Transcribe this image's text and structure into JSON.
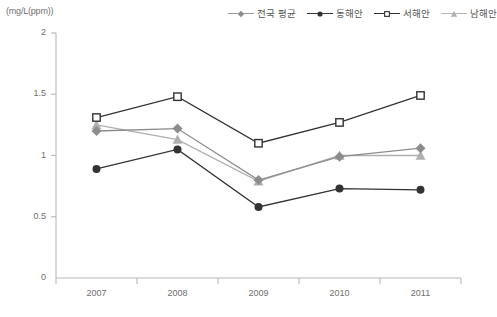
{
  "axis_unit_label": "(mg/L(ppm))",
  "legend": {
    "items": [
      {
        "label": "전국 평균",
        "marker": "diamond",
        "color": "#8c8c8c",
        "line_color": "#9a9a9a"
      },
      {
        "label": "동해안",
        "marker": "circle",
        "color": "#333333",
        "line_color": "#333333"
      },
      {
        "label": "서해안",
        "marker": "square-open",
        "color": "#333333",
        "line_color": "#333333"
      },
      {
        "label": "남해안",
        "marker": "triangle",
        "color": "#b0b0b0",
        "line_color": "#b5b5b5"
      }
    ]
  },
  "chart_data": {
    "type": "line",
    "title": "",
    "xlabel": "",
    "ylabel": "(mg/L(ppm))",
    "categories": [
      "2007",
      "2008",
      "2009",
      "2010",
      "2011"
    ],
    "ylim": [
      0,
      2
    ],
    "yticks": [
      0,
      0.5,
      1,
      1.5,
      2
    ],
    "ytick_labels": [
      "0",
      "0.5",
      "1",
      "1.5",
      "2"
    ],
    "grid": false,
    "legend_position": "top-right",
    "series": [
      {
        "name": "전국 평균",
        "marker": "diamond",
        "color": "#8c8c8c",
        "values": [
          1.2,
          1.22,
          0.8,
          0.99,
          1.06
        ]
      },
      {
        "name": "동해안",
        "marker": "circle",
        "color": "#333333",
        "values": [
          0.89,
          1.05,
          0.58,
          0.73,
          0.72
        ]
      },
      {
        "name": "서해안",
        "marker": "square-open",
        "color": "#333333",
        "values": [
          1.31,
          1.48,
          1.1,
          1.27,
          1.49
        ]
      },
      {
        "name": "남해안",
        "marker": "triangle",
        "color": "#b0b0b0",
        "values": [
          1.25,
          1.13,
          0.79,
          1.0,
          1.0
        ]
      }
    ]
  },
  "plot_geometry": {
    "left": 56,
    "right": 461,
    "top": 33,
    "bottom": 278
  }
}
